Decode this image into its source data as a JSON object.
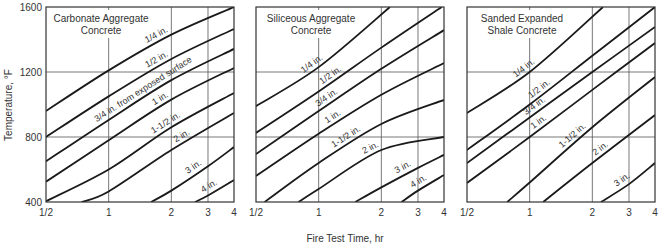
{
  "chart_data": {
    "type": "line",
    "xlabel": "Fire Test Time, hr",
    "ylabel": "Temperature, °F",
    "xscale": "log",
    "xlim": [
      0.5,
      4
    ],
    "ylim": [
      400,
      1600
    ],
    "xticks": [
      0.5,
      1,
      2,
      3,
      4
    ],
    "xtick_labels": [
      "1/2",
      "1",
      "2",
      "3",
      "4"
    ],
    "yticks": [
      400,
      800,
      1200,
      1600
    ],
    "ytick_labels": [
      "400",
      "800",
      "1200",
      "1600"
    ],
    "grid": true,
    "panels": [
      {
        "title": [
          "Carbonate Aggregate",
          "Concrete"
        ],
        "series": [
          {
            "name": "1/4 in.",
            "label": "1/4 in.",
            "points": [
              [
                0.5,
                960
              ],
              [
                1,
                1210
              ],
              [
                2,
                1430
              ],
              [
                4,
                1600
              ]
            ]
          },
          {
            "name": "1/2 in.",
            "label": "1/2 in.",
            "points": [
              [
                0.5,
                800
              ],
              [
                1,
                1050
              ],
              [
                2,
                1280
              ],
              [
                4,
                1465
              ]
            ]
          },
          {
            "name": "3/4 in.",
            "label": "3/4 in. from exposed surface",
            "points": [
              [
                0.5,
                650
              ],
              [
                1,
                905
              ],
              [
                2,
                1150
              ],
              [
                4,
                1342
              ]
            ]
          },
          {
            "name": "1 in.",
            "label": "1 in.",
            "points": [
              [
                0.5,
                525
              ],
              [
                1,
                780
              ],
              [
                2,
                1030
              ],
              [
                4,
                1225
              ]
            ]
          },
          {
            "name": "1-1/2 in.",
            "label": "1-1/2 in.",
            "points": [
              [
                0.5,
                405
              ],
              [
                1,
                600
              ],
              [
                2,
                860
              ],
              [
                4,
                1071
              ]
            ]
          },
          {
            "name": "2 in.",
            "label": "2 in.",
            "points": [
              [
                0.74,
                400
              ],
              [
                1,
                465
              ],
              [
                2,
                720
              ],
              [
                4,
                948
              ]
            ]
          },
          {
            "name": "3 in.",
            "label": "3 in.",
            "points": [
              [
                1.6,
                400
              ],
              [
                2,
                470
              ],
              [
                3,
                620
              ],
              [
                4,
                738
              ]
            ]
          },
          {
            "name": "4 in.",
            "label": "4 in.",
            "points": [
              [
                2.6,
                400
              ],
              [
                3,
                440
              ],
              [
                4,
                535
              ]
            ]
          }
        ]
      },
      {
        "title": [
          "Siliceous Aggregate",
          "Concrete"
        ],
        "series": [
          {
            "name": "1/4 in.",
            "label": "1/4 in.",
            "points": [
              [
                0.5,
                990
              ],
              [
                1,
                1230
              ],
              [
                2.2,
                1600
              ]
            ]
          },
          {
            "name": "1/2 in.",
            "label": "1/2 in.",
            "points": [
              [
                0.5,
                825
              ],
              [
                1,
                1080
              ],
              [
                2,
                1350
              ],
              [
                3.9,
                1600
              ]
            ]
          },
          {
            "name": "3/4 in.",
            "label": "3/4 in.",
            "points": [
              [
                0.5,
                695
              ],
              [
                1,
                960
              ],
              [
                2,
                1220
              ],
              [
                4,
                1458
              ]
            ]
          },
          {
            "name": "1 in.",
            "label": "1 in.",
            "points": [
              [
                0.5,
                560
              ],
              [
                1,
                820
              ],
              [
                2,
                1060
              ],
              [
                4,
                1255
              ]
            ]
          },
          {
            "name": "1-1/2 in.",
            "label": "1-1/2 in.",
            "points": [
              [
                0.55,
                400
              ],
              [
                1,
                640
              ],
              [
                2,
                880
              ],
              [
                4,
                1028
              ]
            ]
          },
          {
            "name": "2 in.",
            "label": "2 in.",
            "points": [
              [
                0.8,
                400
              ],
              [
                1,
                480
              ],
              [
                2,
                720
              ],
              [
                4,
                800
              ]
            ]
          },
          {
            "name": "3 in.",
            "label": "3 in.",
            "points": [
              [
                1.5,
                400
              ],
              [
                2,
                490
              ],
              [
                3,
                610
              ],
              [
                4,
                690
              ]
            ]
          },
          {
            "name": "4 in.",
            "label": "4 in.",
            "points": [
              [
                2.5,
                400
              ],
              [
                3,
                470
              ],
              [
                4,
                566
              ]
            ]
          }
        ]
      },
      {
        "title": [
          "Sanded Expanded",
          "Shale Concrete"
        ],
        "series": [
          {
            "name": "1/4 in.",
            "label": "1/4 in.",
            "points": [
              [
                0.5,
                948
              ],
              [
                1,
                1200
              ],
              [
                2.25,
                1600
              ]
            ]
          },
          {
            "name": "1/2 in.",
            "label": "1/2 in.",
            "points": [
              [
                0.5,
                720
              ],
              [
                1,
                1000
              ],
              [
                2,
                1300
              ],
              [
                4,
                1600
              ]
            ]
          },
          {
            "name": "3/4 in.",
            "label": "3/4 in.",
            "points": [
              [
                0.5,
                640
              ],
              [
                1,
                920
              ],
              [
                2,
                1200
              ],
              [
                4,
                1477
              ]
            ]
          },
          {
            "name": "1 in.",
            "label": "1 in.",
            "points": [
              [
                0.5,
                517
              ],
              [
                1,
                800
              ],
              [
                2,
                1090
              ],
              [
                4,
                1378
              ]
            ]
          },
          {
            "name": "1-1/2 in.",
            "label": "1-1/2 in.",
            "points": [
              [
                0.78,
                400
              ],
              [
                1,
                520
              ],
              [
                2,
                860
              ],
              [
                4,
                1169
              ]
            ]
          },
          {
            "name": "2 in.",
            "label": "2 in.",
            "points": [
              [
                1.16,
                400
              ],
              [
                2,
                640
              ],
              [
                4,
                935
              ]
            ]
          },
          {
            "name": "3 in.",
            "label": "3 in.",
            "points": [
              [
                2.2,
                400
              ],
              [
                3,
                510
              ],
              [
                4,
                640
              ]
            ]
          }
        ]
      }
    ]
  }
}
